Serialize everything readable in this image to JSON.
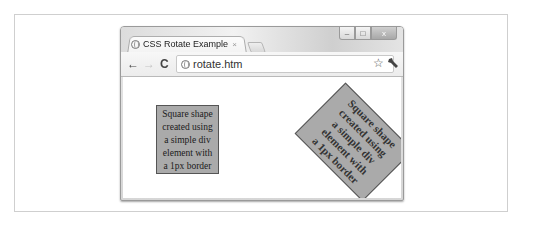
{
  "browser": {
    "tab_title": "CSS Rotate Example",
    "tab_close": "×",
    "address": "rotate.htm",
    "controls": {
      "minimize": "–",
      "maximize": "□",
      "close": "x"
    },
    "nav": {
      "back": "←",
      "forward": "→",
      "reload": "C"
    },
    "bookmark_star": "☆"
  },
  "content": {
    "square_normal": {
      "lines": [
        "Square shape",
        "created using",
        "a simple div",
        "element with",
        "a 1px border"
      ],
      "background": "#aaaaaa",
      "border": "1px solid #555555"
    },
    "square_rotated": {
      "lines": [
        "Square shape",
        "created using",
        "a simple div",
        "element with",
        "a 1px border"
      ],
      "rotation_deg": 45,
      "background": "#aaaaaa"
    }
  }
}
